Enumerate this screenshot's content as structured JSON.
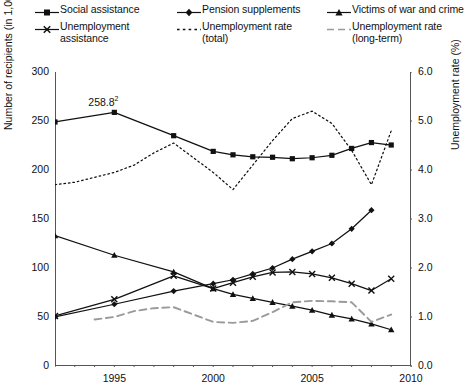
{
  "legend": {
    "columns": [
      [
        {
          "label_line1": "Social assistance",
          "label_line2": "",
          "key": "line-square-marker"
        },
        {
          "label_line1": "Unemployment",
          "label_line2": "assistance",
          "key": "line-cross-marker"
        }
      ],
      [
        {
          "label_line1": "Pension supplements",
          "label_line2": "",
          "key": "line-diamond-marker"
        },
        {
          "label_line1": "Unemployment rate",
          "label_line2": "(total)",
          "key": "dotted-line"
        }
      ],
      [
        {
          "label_line1": "Victims of war and crime",
          "label_line2": "",
          "key": "line-triangle-marker"
        },
        {
          "label_line1": "Unemployment rate",
          "label_line2": "(long-term)",
          "key": "dashed-line-grey"
        }
      ]
    ]
  },
  "axes": {
    "left_title": "Number of recipients (in 1,000s)",
    "right_title": "Unemployment rate (%)",
    "left_ticks": [
      "300",
      "250",
      "200",
      "150",
      "100",
      "50",
      "0"
    ],
    "right_ticks": [
      "6.0",
      "5.0",
      "4.0",
      "3.0",
      "2.0",
      "1.0",
      "0.0"
    ],
    "x_ticks": [
      "1995",
      "2000",
      "2005",
      "2010"
    ]
  },
  "annotation": {
    "value": "258.8",
    "footnote": "2"
  },
  "colors": {
    "line": "#111111",
    "grey_dashed": "#9a9a9a",
    "axis": "#555555",
    "background": "#ffffff"
  },
  "chart_data": {
    "type": "line",
    "title": "",
    "xlabel": "",
    "ylabel": "Number of recipients (in 1,000s)",
    "y2label": "Unemployment rate (%)",
    "xlim": [
      1992,
      2010
    ],
    "ylim": [
      0,
      300
    ],
    "y2lim": [
      0.0,
      6.0
    ],
    "grid": false,
    "legend_position": "top",
    "x": [
      1992,
      1993,
      1994,
      1995,
      1996,
      1997,
      1998,
      1999,
      2000,
      2001,
      2002,
      2003,
      2004,
      2005,
      2006,
      2007,
      2008,
      2009
    ],
    "series": [
      {
        "name": "Social assistance",
        "axis": "left",
        "style": "solid",
        "marker": "square",
        "color": "#111111",
        "x": [
          1992,
          1995,
          1998,
          2000,
          2001,
          2002,
          2003,
          2004,
          2005,
          2006,
          2007,
          2008,
          2009
        ],
        "values": [
          249.0,
          258.8,
          235.0,
          219.0,
          215.5,
          213.5,
          213.0,
          211.5,
          212.5,
          215.0,
          222.0,
          228.0,
          225.5
        ]
      },
      {
        "name": "Pension supplements",
        "axis": "left",
        "style": "solid",
        "marker": "diamond",
        "color": "#111111",
        "x": [
          1992,
          1995,
          1998,
          2000,
          2001,
          2002,
          2003,
          2004,
          2005,
          2006,
          2007,
          2008
        ],
        "values": [
          50.0,
          63.0,
          76.5,
          84.0,
          88.0,
          94.0,
          100.0,
          109.0,
          117.0,
          125.0,
          140.0,
          159.0
        ]
      },
      {
        "name": "Victims of war and crime",
        "axis": "left",
        "style": "solid",
        "marker": "triangle",
        "color": "#111111",
        "x": [
          1992,
          1995,
          1998,
          2000,
          2001,
          2002,
          2003,
          2004,
          2005,
          2006,
          2007,
          2008,
          2009
        ],
        "values": [
          133.0,
          113.0,
          96.0,
          79.0,
          73.0,
          69.0,
          65.0,
          61.0,
          57.0,
          52.0,
          48.0,
          43.0,
          37.0
        ]
      },
      {
        "name": "Unemployment assistance",
        "axis": "left",
        "style": "solid",
        "marker": "cross",
        "color": "#111111",
        "x": [
          1992,
          1995,
          1998,
          2000,
          2001,
          2002,
          2003,
          2004,
          2005,
          2006,
          2007,
          2008,
          2009
        ],
        "values": [
          51.0,
          68.0,
          92.0,
          79.0,
          85.0,
          91.0,
          95.5,
          96.0,
          94.0,
          90.0,
          84.0,
          77.0,
          89.0
        ]
      },
      {
        "name": "Unemployment rate (total)",
        "axis": "right",
        "style": "dotted",
        "marker": "none",
        "color": "#111111",
        "x": [
          1992,
          1993,
          1994,
          1995,
          1996,
          1997,
          1998,
          1999,
          2000,
          2001,
          2002,
          2003,
          2004,
          2005,
          2006,
          2007,
          2008,
          2009
        ],
        "values": [
          3.7,
          3.75,
          3.85,
          3.95,
          4.1,
          4.35,
          4.55,
          4.25,
          3.95,
          3.6,
          4.1,
          4.6,
          5.05,
          5.2,
          4.95,
          4.4,
          3.7,
          4.8
        ]
      },
      {
        "name": "Unemployment rate (long-term)",
        "axis": "right",
        "style": "dashed",
        "marker": "none",
        "color": "#9a9a9a",
        "x": [
          1994,
          1995,
          1996,
          1997,
          1998,
          1999,
          2000,
          2001,
          2002,
          2003,
          2004,
          2005,
          2006,
          2007,
          2008,
          2009
        ],
        "values": [
          0.95,
          1.0,
          1.12,
          1.18,
          1.2,
          1.05,
          0.9,
          0.88,
          0.92,
          1.1,
          1.3,
          1.33,
          1.32,
          1.3,
          0.9,
          1.05
        ]
      }
    ]
  }
}
